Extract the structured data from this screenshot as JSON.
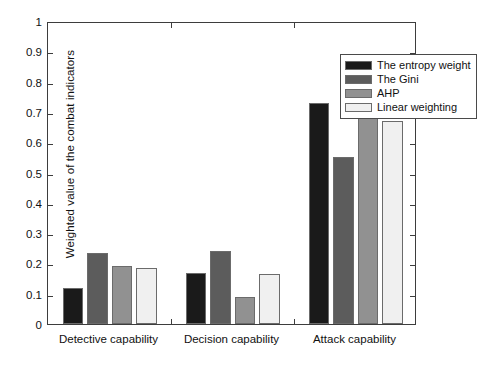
{
  "chart_data": {
    "type": "bar",
    "title": "",
    "xlabel": "",
    "ylabel": "Weighted value of the combat indicators",
    "categories": [
      "Detective capability",
      "Decision capability",
      "Attack capability"
    ],
    "series": [
      {
        "name": "The entropy weight",
        "color": "#1a1a1a",
        "values": [
          0.12,
          0.17,
          0.73
        ]
      },
      {
        "name": "The Gini",
        "color": "#5c5c5c",
        "values": [
          0.235,
          0.24,
          0.55
        ]
      },
      {
        "name": "AHP",
        "color": "#919191",
        "values": [
          0.19,
          0.09,
          0.74
        ]
      },
      {
        "name": "Linear weighting",
        "color": "#f0f0f0",
        "values": [
          0.185,
          0.165,
          0.67
        ]
      }
    ],
    "ylim": [
      0,
      1
    ],
    "yticks": [
      "0",
      "0.1",
      "0.2",
      "0.3",
      "0.4",
      "0.5",
      "0.6",
      "0.7",
      "0.8",
      "0.9",
      "1"
    ],
    "grid": false,
    "legend_position": "top-right"
  },
  "colors": {
    "axis": "#3d3d3d",
    "bar_edge": "#6b6b6b",
    "background": "#ffffff",
    "text": "#111111"
  }
}
